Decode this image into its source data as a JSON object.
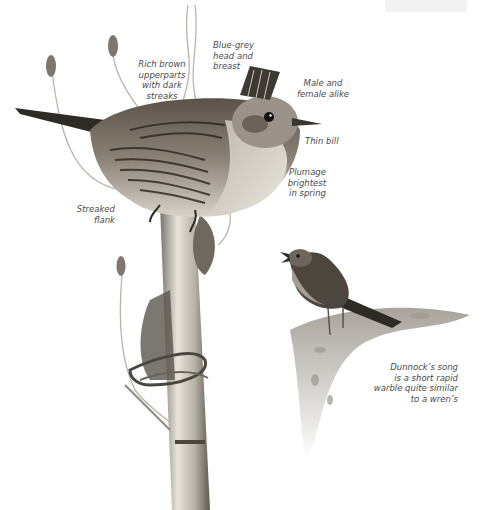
{
  "page": {
    "subject": "Dunnock",
    "colors": {
      "ink": "#4a4a4a",
      "bird_dark": "#2e2a26",
      "bird_mid": "#6b6258",
      "bird_light": "#cfc8bd",
      "stem": "#b9b4ab"
    }
  },
  "annotations": {
    "upperparts": "Rich brown\nupperparts\nwith dark\nstreaks",
    "head": "Blue-grey\nhead and\nbreast",
    "sexes": "Male and\nfemale alike",
    "bill": "Thin bill",
    "plumage": "Plumage\nbrightest\nin spring",
    "flank": "Streaked\nflank",
    "song": "Dunnock’s song\nis a short rapid\nwarble quite similar\nto a wren’s"
  }
}
